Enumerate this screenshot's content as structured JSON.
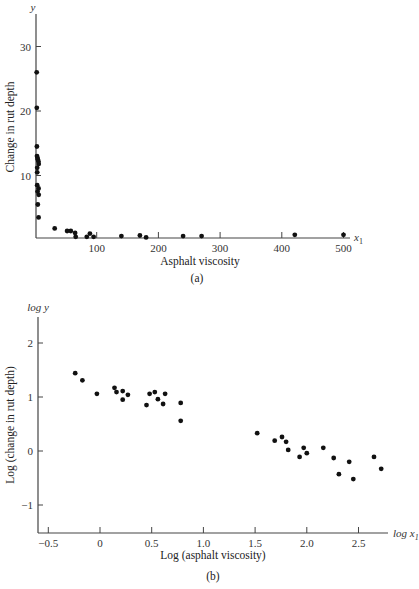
{
  "chart_data": [
    {
      "id": "a",
      "type": "scatter",
      "caption": "(a)",
      "title": "",
      "xlabel": "Asphalt viscosity",
      "ylabel": "Change in rut depth",
      "x_var": "x1",
      "y_var": "y",
      "xlim": [
        0,
        510
      ],
      "ylim": [
        0,
        34
      ],
      "xticks": [
        100,
        200,
        300,
        400,
        500
      ],
      "yticks": [
        10,
        20,
        30
      ],
      "grid": false,
      "legend": null,
      "points": [
        [
          2.8,
          26.0
        ],
        [
          2.9,
          20.5
        ],
        [
          3.0,
          14.5
        ],
        [
          3.3,
          13.0
        ],
        [
          4.0,
          12.7
        ],
        [
          4.5,
          12.5
        ],
        [
          5.5,
          12.2
        ],
        [
          6.0,
          11.8
        ],
        [
          3.5,
          11.2
        ],
        [
          3.5,
          10.5
        ],
        [
          3.6,
          8.5
        ],
        [
          4.2,
          7.5
        ],
        [
          5.8,
          8.0
        ],
        [
          6.0,
          7.0
        ],
        [
          4.5,
          5.5
        ],
        [
          5.9,
          3.5
        ],
        [
          32,
          1.8
        ],
        [
          52,
          1.4
        ],
        [
          58,
          1.4
        ],
        [
          65,
          1.1
        ],
        [
          66,
          0.5
        ],
        [
          84,
          0.5
        ],
        [
          89,
          1.0
        ],
        [
          95,
          0.5
        ],
        [
          140,
          0.6
        ],
        [
          170,
          0.7
        ],
        [
          180,
          0.4
        ],
        [
          240,
          0.6
        ],
        [
          270,
          0.6
        ],
        [
          421,
          0.8
        ],
        [
          500,
          0.8
        ]
      ]
    },
    {
      "id": "b",
      "type": "scatter",
      "caption": "(b)",
      "title": "",
      "xlabel": "Log (asphalt viscosity)",
      "ylabel": "Log (change in rut depth)",
      "x_var": "log x1",
      "y_var": "log y",
      "xlim": [
        -0.6,
        2.75
      ],
      "ylim": [
        -1.5,
        2.5
      ],
      "xticks": [
        -0.5,
        0,
        0.5,
        1.0,
        1.5,
        2.0,
        2.5
      ],
      "xtick_labels": [
        "−0.5",
        "0",
        "0.5",
        "1.0",
        "1.5",
        "2.0",
        "2.5"
      ],
      "yticks": [
        -1,
        0,
        1,
        2
      ],
      "ytick_labels": [
        "−1",
        "0",
        "1",
        "2"
      ],
      "grid": false,
      "legend": null,
      "points": [
        [
          -0.24,
          1.44
        ],
        [
          -0.17,
          1.31
        ],
        [
          -0.03,
          1.06
        ],
        [
          0.14,
          1.17
        ],
        [
          0.16,
          1.09
        ],
        [
          0.22,
          1.11
        ],
        [
          0.22,
          0.95
        ],
        [
          0.27,
          1.04
        ],
        [
          0.45,
          0.85
        ],
        [
          0.48,
          1.06
        ],
        [
          0.53,
          1.09
        ],
        [
          0.56,
          0.96
        ],
        [
          0.61,
          0.87
        ],
        [
          0.63,
          1.06
        ],
        [
          0.78,
          0.89
        ],
        [
          0.78,
          0.56
        ],
        [
          1.52,
          0.33
        ],
        [
          1.69,
          0.19
        ],
        [
          1.76,
          0.26
        ],
        [
          1.8,
          0.17
        ],
        [
          1.82,
          0.02
        ],
        [
          1.93,
          -0.11
        ],
        [
          1.97,
          0.06
        ],
        [
          2.0,
          -0.04
        ],
        [
          2.16,
          0.06
        ],
        [
          2.26,
          -0.13
        ],
        [
          2.31,
          -0.43
        ],
        [
          2.41,
          -0.2
        ],
        [
          2.45,
          -0.52
        ],
        [
          2.65,
          -0.11
        ],
        [
          2.72,
          -0.33
        ]
      ]
    }
  ],
  "labels": {
    "a": {
      "y_var": "y",
      "x_var_base": "x",
      "x_var_sub": "1",
      "ylabel": "Change in rut depth",
      "xlabel": "Asphalt viscosity",
      "caption": "(a)",
      "yticks": [
        "10",
        "20",
        "30"
      ],
      "xticks": [
        "100",
        "200",
        "300",
        "400",
        "500"
      ]
    },
    "b": {
      "y_var": "log y",
      "x_var_prefix": "log ",
      "x_var_base": "x",
      "x_var_sub": "1",
      "ylabel": "Log (change in rut depth)",
      "xlabel": "Log (asphalt viscosity)",
      "caption": "(b)",
      "yticks": [
        "2",
        "1",
        "0",
        "−1"
      ],
      "xticks": [
        "−0.5",
        "0",
        "0.5",
        "1.0",
        "1.5",
        "2.0",
        "2.5"
      ]
    }
  },
  "colors": {
    "axis": "#444444",
    "point": "#111111",
    "text": "#222222"
  }
}
